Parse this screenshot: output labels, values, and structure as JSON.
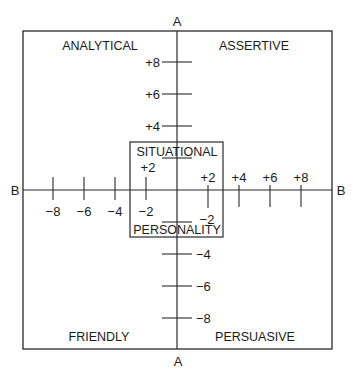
{
  "diagram": {
    "type": "quadrant-grid",
    "vertical_axis_label": "A",
    "horizontal_axis_label": "B",
    "quadrants": {
      "top_left": "ANALYTICAL",
      "top_right": "ASSERTIVE",
      "bottom_left": "FRIENDLY",
      "bottom_right": "PERSUASIVE"
    },
    "inner_box": {
      "top_label": "SITUATIONAL",
      "bottom_label": "PERSONALITY"
    },
    "vertical_ticks": [
      {
        "value": 8,
        "label": "+8"
      },
      {
        "value": 6,
        "label": "+6"
      },
      {
        "value": 4,
        "label": "+4"
      },
      {
        "value": 2,
        "label": "+2"
      },
      {
        "value": -2,
        "label": "−2"
      },
      {
        "value": -4,
        "label": "−4"
      },
      {
        "value": -6,
        "label": "−6"
      },
      {
        "value": -8,
        "label": "−8"
      }
    ],
    "horizontal_ticks": [
      {
        "value": -8,
        "label": "−8"
      },
      {
        "value": -6,
        "label": "−6"
      },
      {
        "value": -4,
        "label": "−4"
      },
      {
        "value": -2,
        "label": "−2"
      },
      {
        "value": 2,
        "label": "+2"
      },
      {
        "value": 4,
        "label": "+4"
      },
      {
        "value": 6,
        "label": "+6"
      },
      {
        "value": 8,
        "label": "+8"
      }
    ],
    "range": [
      -10,
      10
    ]
  }
}
